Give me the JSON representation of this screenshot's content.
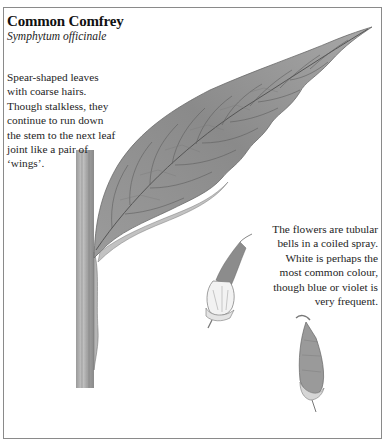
{
  "card": {
    "title": "Common Comfrey",
    "latin_name": "Symphytum officinale",
    "leaf_description": "Spear-shaped leaves with coarse hairs. Though stalkless, they continue to run down the stem to the next leaf joint like a pair of ‘wings’.",
    "flower_description": "The flowers are tubular bells in a coiled spray. White is perhaps the most common colour, though blue or violet is very frequent."
  },
  "illustrations": {
    "leaf": "leaf-with-stem-illustration",
    "flower_open": "open-bell-flower-illustration",
    "flower_bud": "hairy-flower-bud-illustration"
  },
  "colors": {
    "frame_border": "#8a8a8a",
    "leaf_fill": "#8f8f8f",
    "leaf_vein": "#555555",
    "text": "#1e1e1e"
  }
}
